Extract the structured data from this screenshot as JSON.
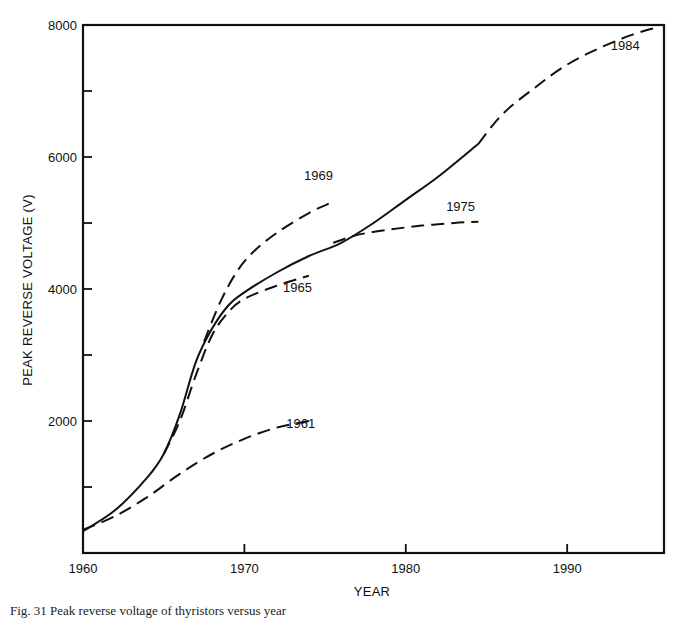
{
  "chart_data": {
    "type": "line",
    "title": "",
    "xlabel": "YEAR",
    "ylabel": "PEAK REVERSE VOLTAGE (V)",
    "xlim": [
      1960,
      1996
    ],
    "ylim": [
      0,
      8000
    ],
    "x_ticks": [
      1960,
      1970,
      1980,
      1990
    ],
    "x_tick_labels": [
      "1960",
      "1970",
      "1980",
      "1990"
    ],
    "y_ticks": [
      1000,
      2000,
      3000,
      4000,
      5000,
      6000,
      7000,
      8000
    ],
    "y_tick_labels": [
      {
        "value": 2000,
        "label": "2000"
      },
      {
        "value": 4000,
        "label": "4000"
      },
      {
        "value": 6000,
        "label": "6000"
      },
      {
        "value": 8000,
        "label": "8000"
      }
    ],
    "grid": false,
    "legend": "none (curves labeled inline)",
    "series": [
      {
        "name": "Actual",
        "style": "solid",
        "x": [
          1960,
          1962,
          1964,
          1965,
          1966,
          1967,
          1968,
          1969,
          1970,
          1972,
          1974,
          1976,
          1978,
          1980,
          1982,
          1984.5
        ],
        "y": [
          330,
          650,
          1150,
          1500,
          2100,
          2900,
          3400,
          3750,
          3950,
          4250,
          4500,
          4700,
          5000,
          5350,
          5700,
          6200
        ]
      },
      {
        "name": "1961",
        "style": "dashed",
        "x": [
          1960,
          1962,
          1964,
          1966,
          1968,
          1970,
          1972,
          1974
        ],
        "y": [
          350,
          560,
          850,
          1200,
          1500,
          1730,
          1900,
          2000
        ],
        "label": "1961",
        "label_at": [
          1972.6,
          1900
        ]
      },
      {
        "name": "1965",
        "style": "dashed",
        "x": [
          1965,
          1966,
          1967,
          1968,
          1969,
          1970,
          1972,
          1974
        ],
        "y": [
          1500,
          2000,
          2700,
          3300,
          3650,
          3850,
          4050,
          4200
        ],
        "label": "1965",
        "label_at": [
          1972.4,
          3950
        ]
      },
      {
        "name": "1969",
        "style": "dashed",
        "x": [
          1967.5,
          1968.5,
          1969.5,
          1970.5,
          1972,
          1974,
          1975.3
        ],
        "y": [
          3200,
          3800,
          4250,
          4550,
          4850,
          5150,
          5300
        ],
        "label": "1969",
        "label_at": [
          1973.7,
          5650
        ]
      },
      {
        "name": "1975",
        "style": "dashed",
        "x": [
          1975.5,
          1977,
          1979,
          1981,
          1983,
          1984.5
        ],
        "y": [
          4700,
          4820,
          4900,
          4960,
          5000,
          5020
        ],
        "label": "1975",
        "label_at": [
          1982.5,
          5180
        ]
      },
      {
        "name": "1984",
        "style": "dashed",
        "x": [
          1984.5,
          1986,
          1988,
          1990,
          1992,
          1994,
          1995.5
        ],
        "y": [
          6200,
          6650,
          7050,
          7400,
          7650,
          7850,
          7960
        ],
        "label": "1984",
        "label_at": [
          1992.7,
          7620
        ]
      }
    ]
  },
  "caption": {
    "text": "Fig. 31  Peak reverse voltage of thyristors versus year"
  }
}
